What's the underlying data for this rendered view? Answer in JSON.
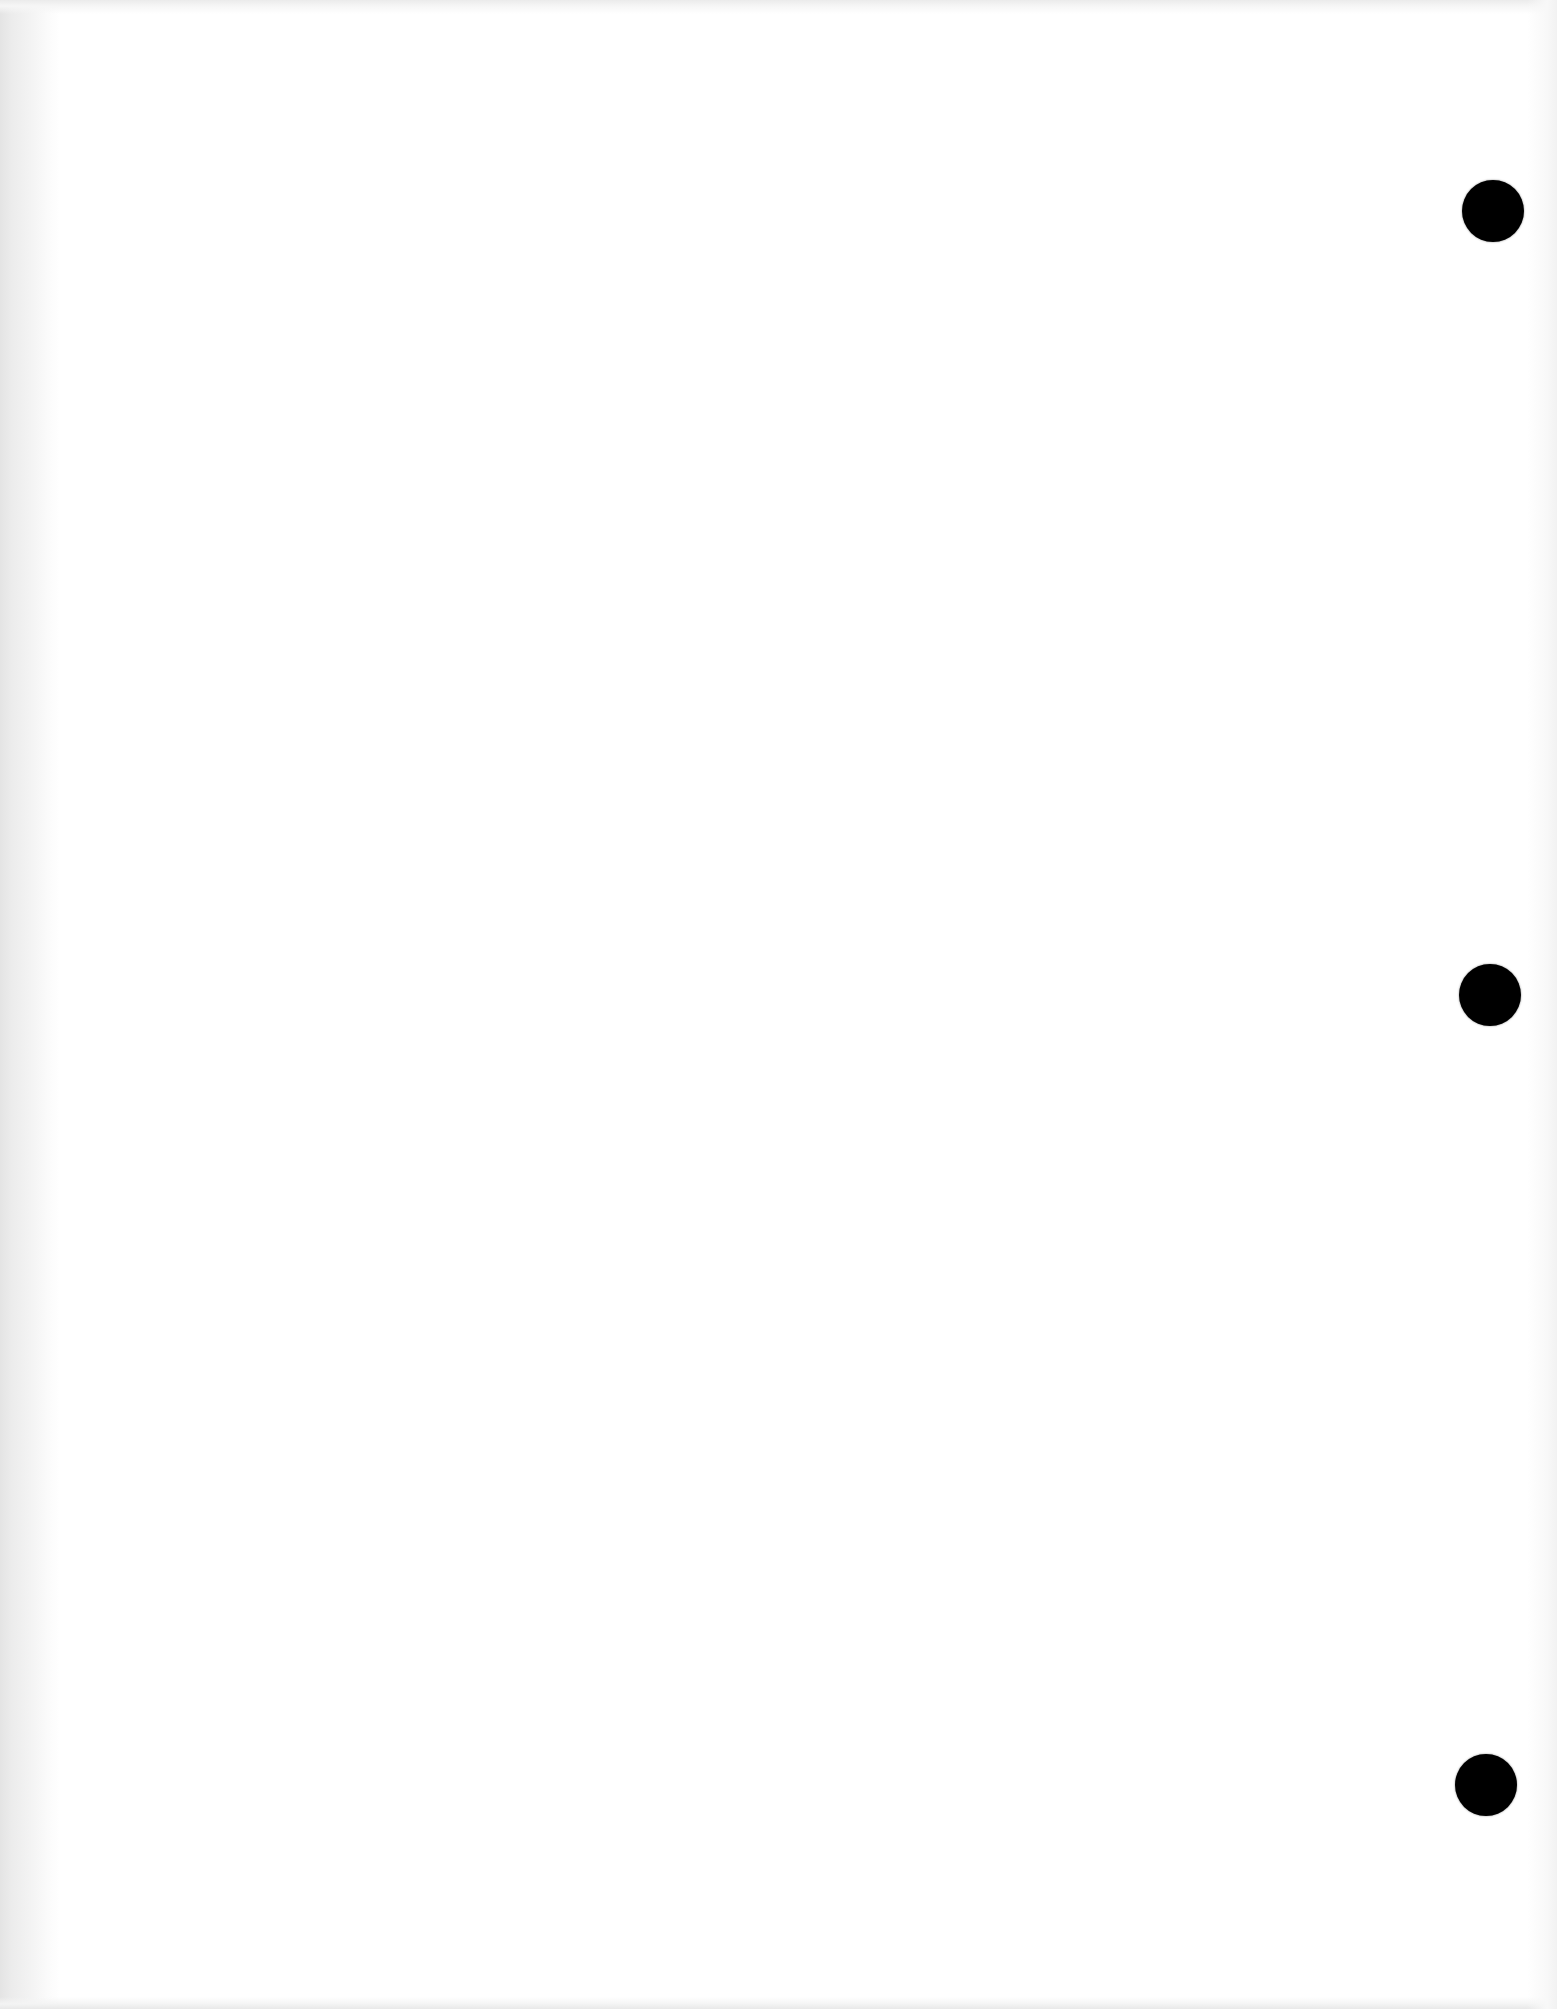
{
  "document": {
    "type": "blank scanned page",
    "text": "",
    "background_color": "#ffffff",
    "hole_color": "#000000",
    "punch_holes": [
      {
        "id": 1,
        "position": "top-right",
        "cx": 1493,
        "cy": 211,
        "diameter": 62
      },
      {
        "id": 2,
        "position": "middle-right",
        "cx": 1490,
        "cy": 995,
        "diameter": 62
      },
      {
        "id": 3,
        "position": "bottom-right",
        "cx": 1486,
        "cy": 1785,
        "diameter": 62
      }
    ]
  }
}
